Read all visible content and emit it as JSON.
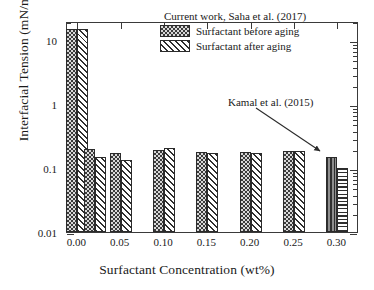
{
  "chart_data": {
    "type": "bar",
    "title": "",
    "xlabel": "Surfactant Concentration (wt%)",
    "ylabel": "Interfacial Tension (mN/m)",
    "yscale": "log",
    "ylim": [
      0.01,
      20
    ],
    "xlim": [
      -0.012,
      0.325
    ],
    "ytick_labels": [
      "10",
      "1",
      "0.1",
      "0.01"
    ],
    "ytick_values": [
      10,
      1,
      0.1,
      0.01
    ],
    "xtick_labels": [
      "0.00",
      "0.05",
      "0.10",
      "0.15",
      "0.20",
      "0.25",
      "0.30"
    ],
    "xtick_values": [
      0.0,
      0.05,
      0.1,
      0.15,
      0.2,
      0.25,
      0.3
    ],
    "grid": false,
    "legend_position": "top-right",
    "categories": [
      0.0,
      0.02,
      0.05,
      0.1,
      0.15,
      0.2,
      0.25,
      0.3
    ],
    "series": [
      {
        "name": "Surfactant before aging",
        "pattern": "checker",
        "values": [
          15.0,
          0.2,
          0.175,
          0.19,
          0.18,
          0.178,
          0.185,
          0.15
        ]
      },
      {
        "name": "Surfactant after aging",
        "pattern": "diagonal-hatch",
        "values": [
          15.0,
          0.15,
          0.135,
          0.205,
          0.172,
          0.17,
          0.185,
          0.1
        ]
      }
    ],
    "annotations": [
      {
        "text": "Kamal et al. (2015)",
        "points_to": 0.3
      }
    ]
  },
  "legend": {
    "title": "Current work, Saha et al. (2017)",
    "entries": [
      {
        "label": "Surfactant before aging"
      },
      {
        "label": "Surfactant after aging"
      }
    ]
  },
  "annotation": {
    "kamal_label": "Kamal et al. (2015)"
  },
  "axes": {
    "x_title": "Surfactant Concentration (wt%)",
    "y_title": "Interfacial Tension (mN/m)"
  }
}
